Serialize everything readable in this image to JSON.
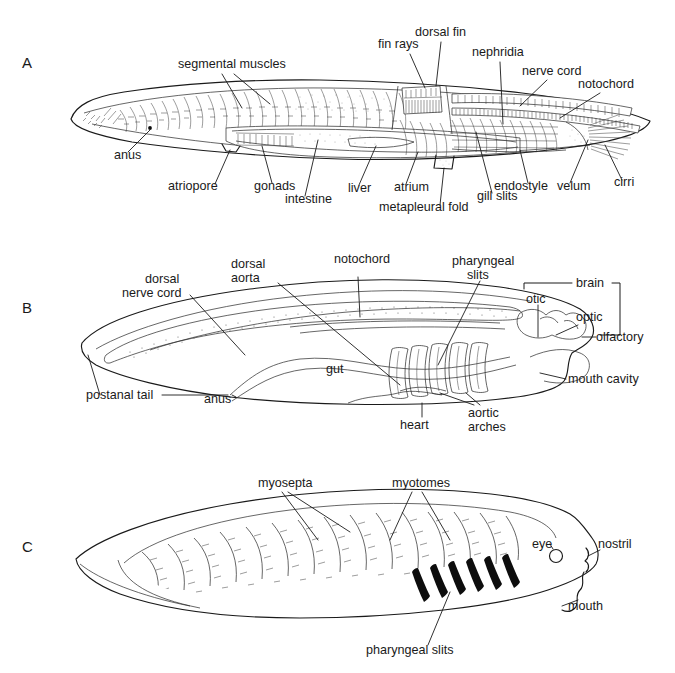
{
  "figure": {
    "background_color": "#ffffff",
    "ink_color": "#1a1a1a",
    "width": 675,
    "height": 673
  },
  "panels": [
    {
      "letter": "A",
      "caption": "Adult amphioxus, lateral cutaway",
      "labels": [
        {
          "id": "segmental-muscles",
          "text": "segmental muscles",
          "x": 178,
          "y": 68
        },
        {
          "id": "dorsal-fin",
          "text": "dorsal fin",
          "x": 415,
          "y": 36
        },
        {
          "id": "fin-rays",
          "text": "fin rays",
          "x": 378,
          "y": 48
        },
        {
          "id": "nephridia",
          "text": "nephridia",
          "x": 472,
          "y": 56
        },
        {
          "id": "nerve-cord",
          "text": "nerve cord",
          "x": 522,
          "y": 75
        },
        {
          "id": "notochord",
          "text": "notochord",
          "x": 578,
          "y": 88
        },
        {
          "id": "anus",
          "text": "anus",
          "x": 114,
          "y": 159
        },
        {
          "id": "atriopore",
          "text": "atriopore",
          "x": 168,
          "y": 190
        },
        {
          "id": "gonads",
          "text": "gonads",
          "x": 254,
          "y": 190
        },
        {
          "id": "intestine",
          "text": "intestine",
          "x": 285,
          "y": 203
        },
        {
          "id": "liver",
          "text": "liver",
          "x": 348,
          "y": 192
        },
        {
          "id": "atrium",
          "text": "atrium",
          "x": 394,
          "y": 191
        },
        {
          "id": "metapleural-fold",
          "text": "metapleural fold",
          "x": 379,
          "y": 211
        },
        {
          "id": "gill-slits",
          "text": "gill slits",
          "x": 477,
          "y": 200
        },
        {
          "id": "endostyle",
          "text": "endostyle",
          "x": 494,
          "y": 190
        },
        {
          "id": "velum",
          "text": "velum",
          "x": 557,
          "y": 190
        },
        {
          "id": "cirri",
          "text": "cirri",
          "x": 614,
          "y": 186
        }
      ]
    },
    {
      "letter": "B",
      "caption": "Schematic chordate body plan, lateral view",
      "labels": [
        {
          "id": "dorsal-nerve-cord",
          "text": "dorsal",
          "text2": "nerve cord",
          "x": 145,
          "y": 283
        },
        {
          "id": "dorsal-aorta",
          "text": "dorsal",
          "text2": "aorta",
          "x": 231,
          "y": 268
        },
        {
          "id": "notochord",
          "text": "notochord",
          "x": 334,
          "y": 263
        },
        {
          "id": "pharyngeal-slits",
          "text": "pharyngeal",
          "text2": "slits",
          "x": 452,
          "y": 265
        },
        {
          "id": "brain",
          "text": "brain",
          "x": 580,
          "y": 287
        },
        {
          "id": "otic",
          "text": "otic",
          "x": 531,
          "y": 303
        },
        {
          "id": "optic",
          "text": "optic",
          "x": 581,
          "y": 320
        },
        {
          "id": "olfactory",
          "text": "olfactory",
          "x": 600,
          "y": 337
        },
        {
          "id": "mouth-cavity",
          "text": "mouth cavity",
          "x": 571,
          "y": 382
        },
        {
          "id": "gut",
          "text": "gut",
          "x": 340,
          "y": 370
        },
        {
          "id": "postanal-tail",
          "text": "postanal tail",
          "x": 113,
          "y": 398
        },
        {
          "id": "anus",
          "text": "anus",
          "x": 221,
          "y": 403
        },
        {
          "id": "heart",
          "text": "heart",
          "x": 414,
          "y": 424
        },
        {
          "id": "aortic-arches",
          "text": "aortic",
          "text2": "arches",
          "x": 478,
          "y": 411
        }
      ],
      "aortic_arch_count": 5
    },
    {
      "letter": "C",
      "caption": "Amphioxus larva, lateral view showing myotomes",
      "labels": [
        {
          "id": "myosepta",
          "text": "myosepta",
          "x": 258,
          "y": 487
        },
        {
          "id": "myotomes",
          "text": "myotomes",
          "x": 392,
          "y": 487
        },
        {
          "id": "eye",
          "text": "eye",
          "x": 549,
          "y": 548
        },
        {
          "id": "nostril",
          "text": "nostril",
          "x": 594,
          "y": 548
        },
        {
          "id": "mouth",
          "text": "mouth",
          "x": 567,
          "y": 608
        },
        {
          "id": "pharyngeal-slits",
          "text": "pharyngeal slits",
          "x": 395,
          "y": 652
        }
      ],
      "pharyngeal_slit_count": 6,
      "myotome_count": 14
    }
  ]
}
